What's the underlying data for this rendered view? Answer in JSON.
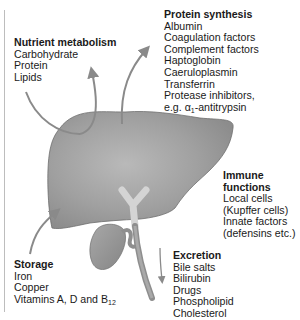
{
  "diagram": {
    "colors": {
      "liver": "#9a9a9a",
      "liver_highlight": "#b8b8b8",
      "arrows": "#8a8a8a",
      "bile_duct": "#cfcfcf",
      "text": "#1a1a1a"
    },
    "nutrient_metabolism": {
      "title": "Nutrient metabolism",
      "items": [
        "Carbohydrate",
        "Protein",
        "Lipids"
      ]
    },
    "protein_synthesis": {
      "title": "Protein synthesis",
      "items": [
        "Albumin",
        "Coagulation factors",
        "Complement factors",
        "Haptoglobin",
        "Caeruloplasmin",
        "Transferrin",
        "Protease inhibitors,"
      ],
      "last_item_prefix": "e.g. ",
      "last_item_symbol": "α",
      "last_item_subscript": "1",
      "last_item_suffix": "-antitrypsin"
    },
    "immune_functions": {
      "title_line1": "Immune",
      "title_line2": "functions",
      "items": [
        "Local cells",
        "(Kupffer cells)",
        "Innate factors",
        "(defensins etc.)"
      ]
    },
    "excretion": {
      "title": "Excretion",
      "items": [
        "Bile salts",
        "Bilirubin",
        "Drugs",
        "Phospholipid",
        "Cholesterol"
      ]
    },
    "storage": {
      "title": "Storage",
      "items": [
        "Iron",
        "Copper"
      ],
      "last_item_prefix": "Vitamins A, D and B",
      "last_item_subscript": "12"
    },
    "icons": [
      "liver-icon",
      "gallbladder-icon",
      "bile-duct-icon",
      "arrow-icon"
    ]
  }
}
